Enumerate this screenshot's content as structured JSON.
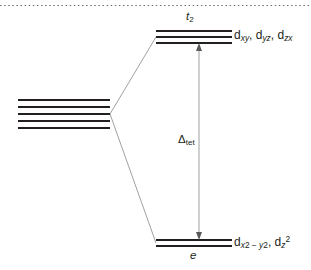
{
  "diagram": {
    "colors": {
      "level_line": "#231f20",
      "connector": "#939598",
      "arrow": "#939598",
      "top_border_dots": "#6d6e71",
      "text": "#231f20",
      "background": "#ffffff"
    },
    "top_border": {
      "style": "dotted"
    },
    "free_ion": {
      "name": "free-ion-d-orbitals",
      "line_count": 5,
      "x_start": 18,
      "x_end": 110,
      "y_values": [
        100,
        107,
        114,
        121,
        128
      ]
    },
    "levels": [
      {
        "id": "t2",
        "term_label": "t",
        "term_sub": "2",
        "orbitals": "d_xy, d_yz, d_zx",
        "line_count": 3,
        "x_start": 156,
        "x_end": 232,
        "y_values": [
          31,
          37,
          43
        ]
      },
      {
        "id": "e",
        "term_label": "e",
        "term_sub": "",
        "orbitals": "d_x2-y2, d_z2",
        "line_count": 2,
        "x_start": 156,
        "x_end": 232,
        "y_values": [
          240,
          246
        ]
      }
    ],
    "splitting": {
      "symbol": "Δ",
      "subscript": "tet",
      "arrow_x": 199,
      "arrow_top": 44,
      "arrow_bottom": 239,
      "double_headed": true
    },
    "connectors": [
      {
        "name": "connector-to-t2",
        "x1": 110,
        "y1": 114,
        "x2": 156,
        "y2": 37
      },
      {
        "name": "connector-to-e",
        "x1": 110,
        "y1": 114,
        "x2": 156,
        "y2": 243
      }
    ],
    "labels": {
      "t2_term": "t",
      "t2_term_sub": "2",
      "t2_orbital_d": "d",
      "t2_orbital_sub1": "xy",
      "t2_orbital_sep1": ", d",
      "t2_orbital_sub2": "yz",
      "t2_orbital_sep2": ", d",
      "t2_orbital_sub3": "zx",
      "e_term": "e",
      "e_orbital_d": "d",
      "e_orbital_sub1_a": "x",
      "e_orbital_sub1_b": "2",
      "e_orbital_sub1_c": " − ",
      "e_orbital_sub1_d": "y",
      "e_orbital_sub1_e": "2",
      "e_orbital_sep": ", d",
      "e_orbital_sub2": "z",
      "e_orbital_sup2": "2",
      "delta_symbol": "Δ",
      "delta_sub": "tet"
    }
  }
}
